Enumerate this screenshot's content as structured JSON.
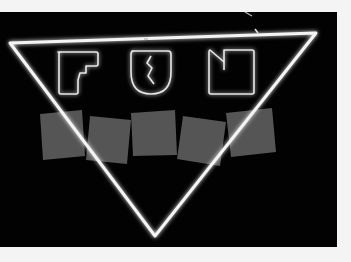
{
  "image": {
    "description": "Black-and-white photo of a neon sign: an inverted triangle outline enclosing the word FUN in outlined neon letters, with five gray tilted squares across the middle",
    "sign_text": "FUN",
    "letters": [
      "F",
      "U",
      "N"
    ],
    "square_count": 5,
    "colors": {
      "background_border": "#f4f4f4",
      "photo_background": "#020202",
      "neon": "#f2f2f2",
      "squares": "#555555"
    }
  }
}
